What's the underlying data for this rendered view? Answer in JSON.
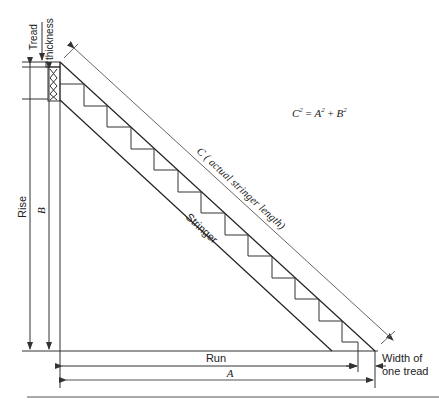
{
  "diagram": {
    "formula": {
      "C": "C",
      "A": "A",
      "B": "B",
      "sup": "2",
      "eq": " = ",
      "plus": " + "
    },
    "labels": {
      "tread_thickness_line1": "Tread",
      "tread_thickness_line2": "thickness",
      "rise": "Rise",
      "b": "B",
      "run": "Run",
      "a": "A",
      "stringer": "Stringer",
      "c_label": "C ( actual stringer length)",
      "width_line1": "Width of",
      "width_line2": "one tread"
    },
    "steps_count": 12,
    "line_color": "#222222",
    "dim_color": "#555555"
  }
}
